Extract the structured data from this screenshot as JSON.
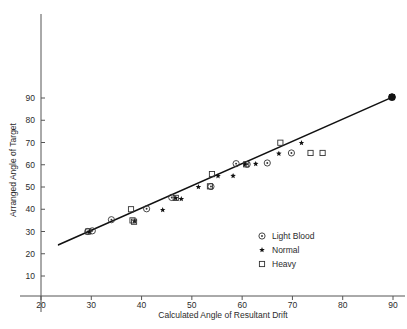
{
  "chart_data": {
    "type": "scatter",
    "title": "",
    "xlabel": "Calculated Angle of Resultant Drift",
    "ylabel": "Arranged Angle of Target",
    "xlim": [
      17,
      93
    ],
    "ylim": [
      4,
      100
    ],
    "xticks": [
      20,
      30,
      40,
      50,
      60,
      70,
      80,
      90
    ],
    "yticks": [
      10,
      20,
      30,
      40,
      50,
      60,
      70,
      80,
      90
    ],
    "xtick_labels": [
      "20",
      "30",
      "40",
      "50",
      "60",
      "70",
      "80",
      "90"
    ],
    "ytick_labels": [
      "10",
      "20",
      "30",
      "40",
      "50",
      "60",
      "70",
      "80",
      "90"
    ],
    "grid": false,
    "legend_position": "lower-right",
    "trendline": {
      "name": "regression-line",
      "x_start": 23.5,
      "y_start": 24.0,
      "x_end": 90.0,
      "y_end": 90.5,
      "color": "#111111"
    },
    "series": [
      {
        "name": "Light Blood",
        "marker": "circle-dot",
        "color": "#333333",
        "points": [
          {
            "x": 29.3,
            "y": 30.0
          },
          {
            "x": 30.2,
            "y": 30.3
          },
          {
            "x": 34.0,
            "y": 35.3
          },
          {
            "x": 41.0,
            "y": 40.2
          },
          {
            "x": 46.0,
            "y": 45.3
          },
          {
            "x": 53.8,
            "y": 50.2
          },
          {
            "x": 58.8,
            "y": 60.5
          },
          {
            "x": 61.0,
            "y": 60.2
          },
          {
            "x": 65.0,
            "y": 60.8
          },
          {
            "x": 69.8,
            "y": 65.3
          },
          {
            "x": 89.8,
            "y": 90.4
          }
        ]
      },
      {
        "name": "Normal",
        "marker": "star",
        "color": "#111111",
        "points": [
          {
            "x": 29.6,
            "y": 29.8
          },
          {
            "x": 38.6,
            "y": 34.6
          },
          {
            "x": 44.2,
            "y": 39.7
          },
          {
            "x": 46.8,
            "y": 45.0
          },
          {
            "x": 47.9,
            "y": 44.6
          },
          {
            "x": 51.3,
            "y": 50.0
          },
          {
            "x": 55.2,
            "y": 54.9
          },
          {
            "x": 58.2,
            "y": 55.0
          },
          {
            "x": 60.6,
            "y": 60.2
          },
          {
            "x": 62.7,
            "y": 60.4
          },
          {
            "x": 67.3,
            "y": 65.0
          },
          {
            "x": 71.8,
            "y": 69.8
          },
          {
            "x": 89.8,
            "y": 90.4
          }
        ]
      },
      {
        "name": "Heavy",
        "marker": "square",
        "color": "#333333",
        "points": [
          {
            "x": 29.4,
            "y": 30.0
          },
          {
            "x": 37.9,
            "y": 40.0
          },
          {
            "x": 38.2,
            "y": 35.0
          },
          {
            "x": 38.5,
            "y": 34.4
          },
          {
            "x": 46.8,
            "y": 45.1
          },
          {
            "x": 53.6,
            "y": 50.3
          },
          {
            "x": 54.0,
            "y": 55.8
          },
          {
            "x": 60.8,
            "y": 60.2
          },
          {
            "x": 67.6,
            "y": 69.9
          },
          {
            "x": 73.6,
            "y": 65.3
          },
          {
            "x": 76.0,
            "y": 65.3
          },
          {
            "x": 89.8,
            "y": 90.4
          }
        ]
      }
    ],
    "legend": [
      {
        "label": "Light Blood",
        "marker": "circle-dot"
      },
      {
        "label": "Normal",
        "marker": "star"
      },
      {
        "label": "Heavy",
        "marker": "square"
      }
    ]
  }
}
